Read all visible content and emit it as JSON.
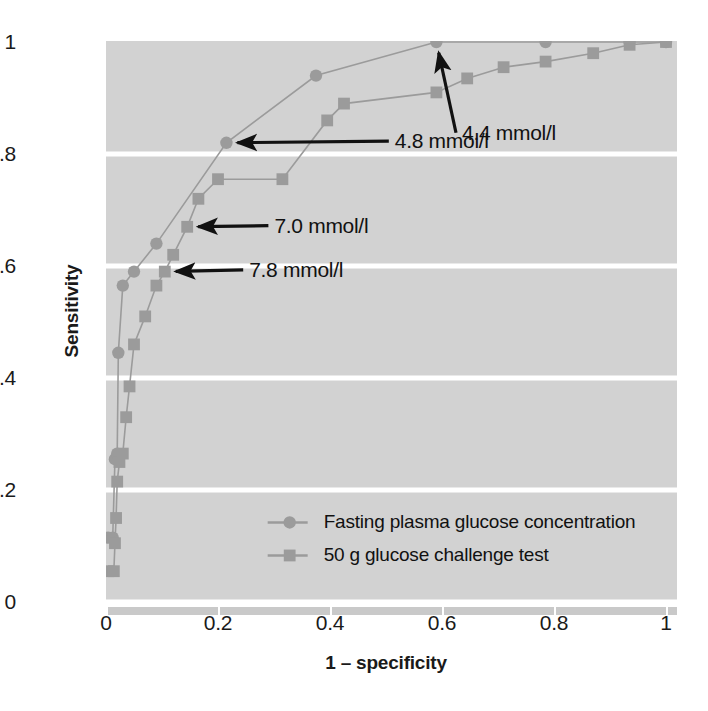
{
  "figure": {
    "axis_titles": {
      "y": "Sensitivity",
      "x": "1 – specificity"
    }
  },
  "chart_data": {
    "type": "line",
    "title": "",
    "xlabel": "1 – specificity",
    "ylabel": "Sensitivity",
    "xlim": [
      0,
      1
    ],
    "ylim": [
      0,
      1
    ],
    "xticks": [
      "0",
      "0.2",
      "0.4",
      "0.6",
      "0.8",
      "1"
    ],
    "yticks": [
      "0",
      "0.2",
      "0.4",
      "0.6",
      "0.8",
      "1"
    ],
    "xtick_values": [
      0,
      0.2,
      0.4,
      0.6,
      0.8,
      1
    ],
    "ytick_values": [
      0,
      0.2,
      0.4,
      0.6,
      0.8,
      1
    ],
    "grid": "horizontal-white-on-gray",
    "legend_position": "inside-lower-right",
    "plot_background": "#d2d2d2",
    "gridline_color": "#ffffff",
    "series_color": "#9b9b9b",
    "annotation_color": "#111111",
    "series": [
      {
        "name": "Fasting plasma glucose concentration",
        "marker": "circle",
        "points": [
          [
            0.004,
            0.115
          ],
          [
            0.012,
            0.115
          ],
          [
            0.016,
            0.255
          ],
          [
            0.02,
            0.265
          ],
          [
            0.022,
            0.445
          ],
          [
            0.03,
            0.565
          ],
          [
            0.05,
            0.59
          ],
          [
            0.09,
            0.64
          ],
          [
            0.215,
            0.82
          ],
          [
            0.375,
            0.94
          ],
          [
            0.59,
            1.0
          ],
          [
            0.785,
            1.0
          ],
          [
            0.935,
            1.0
          ],
          [
            1.0,
            1.0
          ]
        ]
      },
      {
        "name": "50 g glucose challenge test",
        "marker": "square",
        "points": [
          [
            0.004,
            0.055
          ],
          [
            0.014,
            0.055
          ],
          [
            0.016,
            0.105
          ],
          [
            0.018,
            0.15
          ],
          [
            0.02,
            0.215
          ],
          [
            0.024,
            0.25
          ],
          [
            0.03,
            0.265
          ],
          [
            0.036,
            0.33
          ],
          [
            0.042,
            0.385
          ],
          [
            0.05,
            0.46
          ],
          [
            0.07,
            0.51
          ],
          [
            0.09,
            0.565
          ],
          [
            0.105,
            0.59
          ],
          [
            0.12,
            0.62
          ],
          [
            0.145,
            0.67
          ],
          [
            0.165,
            0.72
          ],
          [
            0.2,
            0.755
          ],
          [
            0.315,
            0.755
          ],
          [
            0.395,
            0.86
          ],
          [
            0.425,
            0.89
          ],
          [
            0.59,
            0.91
          ],
          [
            0.645,
            0.935
          ],
          [
            0.71,
            0.955
          ],
          [
            0.785,
            0.965
          ],
          [
            0.87,
            0.98
          ],
          [
            0.935,
            0.995
          ],
          [
            1.0,
            1.0
          ]
        ]
      }
    ],
    "annotations": [
      {
        "label": "4.4 mmol/l",
        "target": [
          0.59,
          1.0
        ],
        "text_x": 0.625,
        "text_y": 0.838
      },
      {
        "label": "4.8 mmol/l",
        "target": [
          0.215,
          0.82
        ],
        "text_x": 0.505,
        "text_y": 0.823
      },
      {
        "label": "7.0 mmol/l",
        "target": [
          0.145,
          0.67
        ],
        "text_x": 0.29,
        "text_y": 0.672
      },
      {
        "label": "7.8 mmol/l",
        "target": [
          0.105,
          0.59
        ],
        "text_x": 0.245,
        "text_y": 0.593
      }
    ],
    "legend": [
      {
        "label": "Fasting plasma glucose concentration",
        "marker": "circle"
      },
      {
        "label": "50 g glucose challenge test",
        "marker": "square"
      }
    ]
  }
}
